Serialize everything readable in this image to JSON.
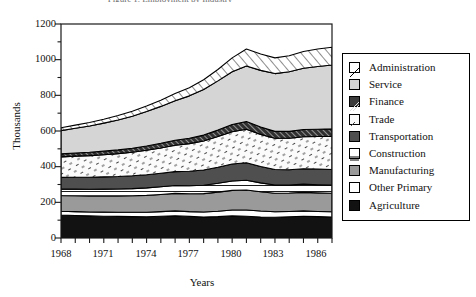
{
  "figure": {
    "title_clipped": "Figure 1. Employment by Industry",
    "background": "#ffffff"
  },
  "axes": {
    "y_title": "Thousands",
    "x_title": "Years",
    "y_ticks": [
      "0",
      "200",
      "400",
      "600",
      "800",
      "1000",
      "1200"
    ],
    "x_ticks": [
      "1968",
      "1971",
      "1974",
      "1977",
      "1980",
      "1983",
      "1986"
    ]
  },
  "legend": {
    "items": [
      {
        "label": "Administration",
        "swatch": "diag-up-wide",
        "fill": "#ffffff"
      },
      {
        "label": "Service",
        "swatch": "solid-light",
        "fill": "#d5d5d5"
      },
      {
        "label": "Finance",
        "swatch": "diag-dark",
        "fill": "#3a3a3a"
      },
      {
        "label": "Trade",
        "swatch": "speckle",
        "fill": "#fafafa"
      },
      {
        "label": "Transportation",
        "swatch": "solid-dark",
        "fill": "#4f4f4f"
      },
      {
        "label": "Construction",
        "swatch": "horiz-lines",
        "fill": "#ffffff"
      },
      {
        "label": "Manufacturing",
        "swatch": "solid-mid",
        "fill": "#9a9a9a"
      },
      {
        "label": "Other Primary",
        "swatch": "solid-white",
        "fill": "#ffffff"
      },
      {
        "label": "Agriculture",
        "swatch": "solid-black",
        "fill": "#121212"
      }
    ]
  },
  "chart_data": {
    "type": "area",
    "title": "Figure 1. Employment by Industry",
    "xlabel": "Years",
    "ylabel": "Thousands",
    "xlim": [
      1968,
      1987
    ],
    "ylim": [
      0,
      1200
    ],
    "grid": false,
    "legend_position": "right",
    "stacked": true,
    "stack_order_bottom_to_top": [
      "Agriculture",
      "Other Primary",
      "Manufacturing",
      "Construction",
      "Transportation",
      "Trade",
      "Finance",
      "Service",
      "Administration"
    ],
    "x": [
      1968,
      1969,
      1970,
      1971,
      1972,
      1973,
      1974,
      1975,
      1976,
      1977,
      1978,
      1979,
      1980,
      1981,
      1982,
      1983,
      1984,
      1985,
      1986,
      1987
    ],
    "series": [
      {
        "name": "Agriculture",
        "values": [
          128,
          126,
          124,
          122,
          121,
          120,
          119,
          122,
          125,
          121,
          118,
          120,
          124,
          122,
          118,
          116,
          119,
          122,
          120,
          118
        ]
      },
      {
        "name": "Other Primary",
        "values": [
          22,
          22,
          22,
          23,
          23,
          24,
          25,
          26,
          27,
          27,
          28,
          30,
          33,
          35,
          33,
          31,
          30,
          30,
          29,
          29
        ]
      },
      {
        "name": "Manufacturing",
        "values": [
          88,
          89,
          90,
          91,
          92,
          93,
          95,
          96,
          98,
          100,
          103,
          107,
          110,
          112,
          108,
          104,
          103,
          104,
          104,
          104
        ]
      },
      {
        "name": "Construction",
        "values": [
          36,
          37,
          37,
          38,
          39,
          40,
          42,
          43,
          44,
          45,
          47,
          50,
          53,
          55,
          50,
          46,
          45,
          46,
          46,
          46
        ]
      },
      {
        "name": "Transportation",
        "values": [
          66,
          67,
          68,
          69,
          70,
          72,
          74,
          76,
          78,
          81,
          85,
          90,
          95,
          98,
          92,
          87,
          86,
          86,
          87,
          87
        ]
      },
      {
        "name": "Trade",
        "values": [
          115,
          118,
          121,
          124,
          128,
          132,
          137,
          142,
          148,
          155,
          163,
          172,
          181,
          188,
          180,
          175,
          176,
          180,
          183,
          186
        ]
      },
      {
        "name": "Finance",
        "values": [
          17,
          18,
          19,
          20,
          21,
          22,
          24,
          26,
          28,
          30,
          33,
          36,
          40,
          43,
          41,
          39,
          39,
          40,
          41,
          42
        ]
      },
      {
        "name": "Service",
        "values": [
          130,
          138,
          147,
          157,
          168,
          180,
          193,
          207,
          222,
          238,
          256,
          276,
          296,
          312,
          318,
          324,
          334,
          344,
          352,
          358
        ]
      },
      {
        "name": "Administration",
        "values": [
          16,
          18,
          20,
          22,
          25,
          28,
          31,
          35,
          40,
          46,
          54,
          64,
          78,
          95,
          92,
          88,
          90,
          94,
          98,
          100
        ]
      }
    ]
  }
}
